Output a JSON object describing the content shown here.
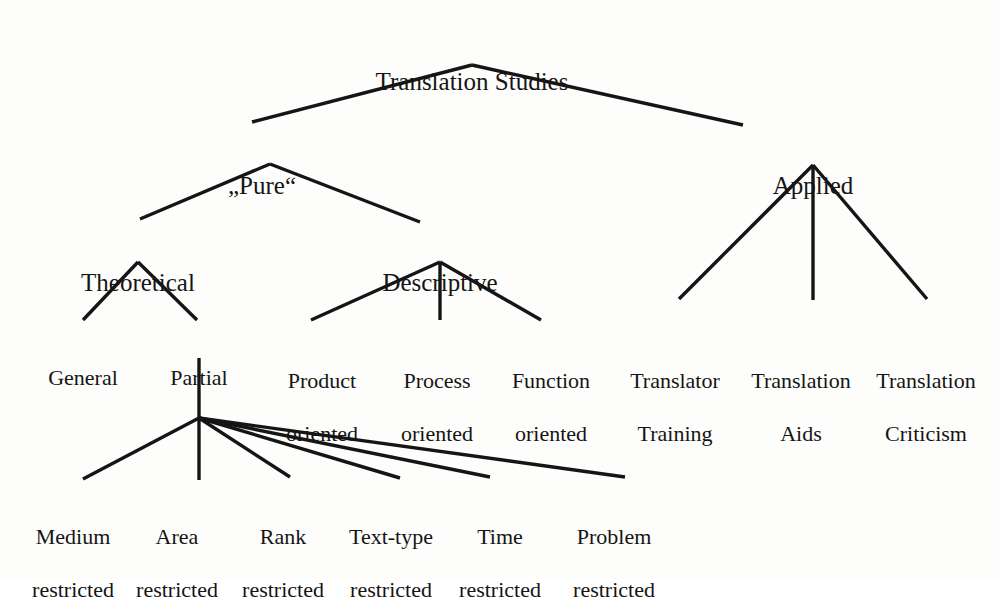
{
  "figure": {
    "kind": "tree-diagram",
    "title": "Translation Studies",
    "background_color": "#fdfdfb",
    "ink_color": "#151515"
  },
  "nodes": {
    "root": {
      "label": "Translation Studies",
      "x": 472,
      "y": 40
    },
    "pure": {
      "label": "„Pure“",
      "x": 262,
      "y": 144
    },
    "applied": {
      "label": "Applied",
      "x": 813,
      "y": 144
    },
    "theoretical": {
      "label": "Theoretical",
      "x": 138,
      "y": 241
    },
    "descriptive": {
      "label": "Descriptive",
      "x": 440,
      "y": 241
    },
    "general": {
      "label": "General",
      "x": 83,
      "y": 341
    },
    "partial": {
      "label": "Partial",
      "x": 199,
      "y": 341
    },
    "product_oriented": {
      "line1": "Product",
      "line2": "oriented",
      "x": 322,
      "y": 341
    },
    "process_oriented": {
      "line1": "Process",
      "line2": "oriented",
      "x": 437,
      "y": 341
    },
    "function_oriented": {
      "line1": "Function",
      "line2": "oriented",
      "x": 551,
      "y": 341
    },
    "translator_training": {
      "line1": "Translator",
      "line2": "Training",
      "x": 675,
      "y": 341
    },
    "translation_aids": {
      "line1": "Translation",
      "line2": "Aids",
      "x": 801,
      "y": 341
    },
    "translation_criticism": {
      "line1": "Translation",
      "line2": "Criticism",
      "x": 926,
      "y": 341
    },
    "medium_restricted": {
      "line1": "Medium",
      "line2": "restricted",
      "x": 73,
      "y": 497
    },
    "area_restricted": {
      "line1": "Area",
      "line2": "restricted",
      "x": 177,
      "y": 497
    },
    "rank_restricted": {
      "line1": "Rank",
      "line2": "restricted",
      "x": 283,
      "y": 497
    },
    "texttype_restricted": {
      "line1": "Text-type",
      "line2": "restricted",
      "x": 391,
      "y": 497
    },
    "time_restricted": {
      "line1": "Time",
      "line2": "restricted",
      "x": 500,
      "y": 497
    },
    "problem_restricted": {
      "line1": "Problem",
      "line2": "restricted",
      "x": 614,
      "y": 497
    }
  },
  "edges": [
    {
      "from": "root",
      "to": "pure",
      "x1": 472,
      "y1": 65,
      "x2": 252,
      "y2": 122
    },
    {
      "from": "root",
      "to": "applied",
      "x1": 472,
      "y1": 65,
      "x2": 743,
      "y2": 125
    },
    {
      "from": "pure",
      "to": "theoretical",
      "x1": 270,
      "y1": 164,
      "x2": 140,
      "y2": 219
    },
    {
      "from": "pure",
      "to": "descriptive",
      "x1": 270,
      "y1": 164,
      "x2": 420,
      "y2": 222
    },
    {
      "from": "applied",
      "to": "translator_training",
      "x1": 813,
      "y1": 165,
      "x2": 679,
      "y2": 299
    },
    {
      "from": "applied",
      "to": "translation_aids",
      "x1": 813,
      "y1": 165,
      "x2": 813,
      "y2": 300
    },
    {
      "from": "applied",
      "to": "translation_criticism",
      "x1": 813,
      "y1": 165,
      "x2": 927,
      "y2": 299
    },
    {
      "from": "theoretical",
      "to": "general",
      "x1": 138,
      "y1": 262,
      "x2": 83,
      "y2": 320
    },
    {
      "from": "theoretical",
      "to": "partial",
      "x1": 138,
      "y1": 262,
      "x2": 197,
      "y2": 320
    },
    {
      "from": "descriptive",
      "to": "product_oriented",
      "x1": 440,
      "y1": 262,
      "x2": 311,
      "y2": 320
    },
    {
      "from": "descriptive",
      "to": "process_oriented",
      "x1": 440,
      "y1": 262,
      "x2": 440,
      "y2": 320
    },
    {
      "from": "descriptive",
      "to": "function_oriented",
      "x1": 440,
      "y1": 262,
      "x2": 541,
      "y2": 320
    },
    {
      "from": "partial",
      "to": "fan_hub",
      "x1": 199,
      "y1": 358,
      "x2": 199,
      "y2": 418
    },
    {
      "from": "fan_hub",
      "to": "medium_restricted",
      "x1": 199,
      "y1": 418,
      "x2": 83,
      "y2": 479
    },
    {
      "from": "fan_hub",
      "to": "area_restricted",
      "x1": 199,
      "y1": 418,
      "x2": 199,
      "y2": 480
    },
    {
      "from": "fan_hub",
      "to": "rank_restricted",
      "x1": 199,
      "y1": 418,
      "x2": 290,
      "y2": 477
    },
    {
      "from": "fan_hub",
      "to": "texttype_restricted",
      "x1": 199,
      "y1": 418,
      "x2": 400,
      "y2": 478
    },
    {
      "from": "fan_hub",
      "to": "time_restricted",
      "x1": 199,
      "y1": 418,
      "x2": 490,
      "y2": 477
    },
    {
      "from": "fan_hub",
      "to": "problem_restricted",
      "x1": 199,
      "y1": 418,
      "x2": 625,
      "y2": 477
    }
  ]
}
